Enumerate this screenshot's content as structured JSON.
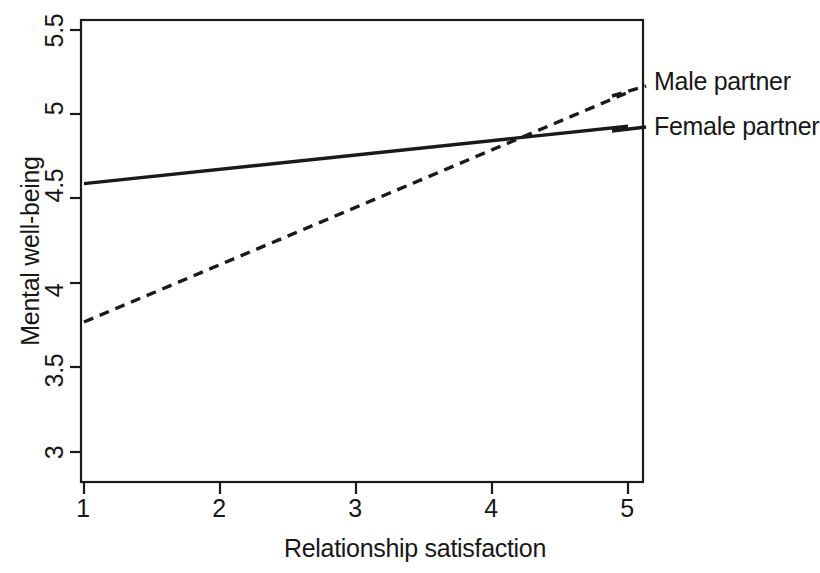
{
  "chart_data": {
    "type": "line",
    "title": "",
    "xlabel": "Relationship satisfaction",
    "ylabel": "Mental well-being",
    "xlim": [
      1,
      5
    ],
    "ylim": [
      3,
      5.5
    ],
    "xticks": [
      "1",
      "2",
      "3",
      "4",
      "5"
    ],
    "yticks": [
      "3",
      "3.5",
      "4",
      "4.5",
      "5",
      "5.5"
    ],
    "grid": false,
    "legend_position": "right",
    "x": [
      1,
      5
    ],
    "series": [
      {
        "name": "Male partner",
        "values": [
          3.77,
          5.13
        ],
        "style": "dashed",
        "color": "#1a1a1a"
      },
      {
        "name": "Female partner",
        "values": [
          4.59,
          4.93
        ],
        "style": "solid",
        "color": "#1a1a1a"
      }
    ]
  },
  "axes": {
    "y_title": "Mental well-being",
    "x_title": "Relationship satisfaction",
    "y_tick_labels": [
      "5.5",
      "5",
      "4.5",
      "4",
      "3.5",
      "3"
    ],
    "x_tick_labels": [
      "1",
      "2",
      "3",
      "4",
      "5"
    ]
  },
  "legend": {
    "entries": [
      {
        "label": "Male partner",
        "style": "dashed"
      },
      {
        "label": "Female partner",
        "style": "solid"
      }
    ]
  },
  "colors": {
    "ink": "#1a1a1a",
    "background": "#ffffff"
  }
}
